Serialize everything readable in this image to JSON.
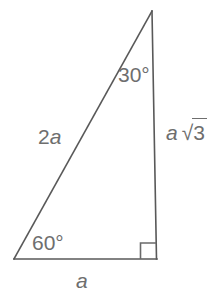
{
  "figure": {
    "type": "right-triangle-30-60-90",
    "background_color": "#ffffff",
    "stroke_color": "#595959",
    "text_color": "#6e6e6e",
    "stroke_width": 1.6,
    "vertices": {
      "apex": [
        152,
        11
      ],
      "bottom_left": [
        14,
        259
      ],
      "bottom_right": [
        156,
        259
      ]
    },
    "right_angle_marker": {
      "corner": "bottom_right",
      "size": 16
    },
    "labels": {
      "angle_top": "30°",
      "angle_bottom": "60°",
      "side_hypotenuse_prefix": "2",
      "side_hypotenuse_var": "a",
      "side_base": "a",
      "side_vertical_var": "a",
      "side_vertical_surd": "√",
      "side_vertical_radicand": "3"
    }
  }
}
